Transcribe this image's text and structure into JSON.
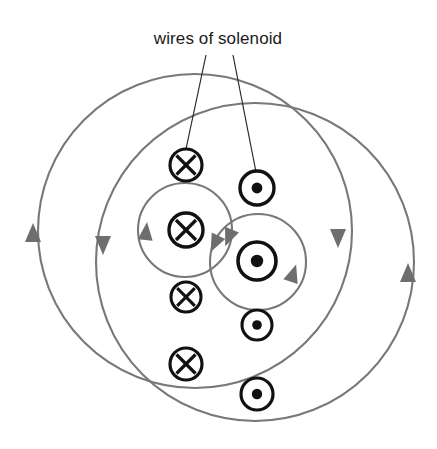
{
  "figure": {
    "title": "wires of solenoid",
    "caption_label": "wires of solenoid",
    "label_position": {
      "x": 218,
      "y": 44
    },
    "colors": {
      "field_line": "#787878",
      "wire_symbol": "#111111",
      "leader_line": "#2a2a2a",
      "label_text": "#1a1a1a",
      "background": "#ffffff"
    },
    "leaders": [
      {
        "name": "leader-to-x-wire",
        "x1": 206,
        "y1": 55,
        "x2": 186,
        "y2": 149
      },
      {
        "name": "leader-to-dot-wire",
        "x1": 233,
        "y1": 55,
        "x2": 256,
        "y2": 172
      }
    ],
    "field_lines": [
      {
        "name": "outer-left-field-line",
        "cx": 195,
        "cy": 231,
        "r": 157,
        "direction": "clockwise"
      },
      {
        "name": "outer-right-field-line",
        "cx": 255,
        "cy": 262,
        "r": 159,
        "direction": "clockwise"
      },
      {
        "name": "inner-left-field-line",
        "cx": 185,
        "cy": 230,
        "r": 47,
        "direction": "clockwise"
      },
      {
        "name": "inner-right-field-line",
        "cx": 258,
        "cy": 262,
        "r": 48,
        "direction": "clockwise"
      }
    ],
    "field_arrows": [
      {
        "name": "arrow-outer-left-west",
        "x": 33,
        "y": 232,
        "rotation": 0
      },
      {
        "name": "arrow-outer-left-east",
        "x": 338,
        "y": 239,
        "rotation": 180
      },
      {
        "name": "arrow-outer-right-west",
        "x": 103,
        "y": 246,
        "rotation": 180
      },
      {
        "name": "arrow-outer-right-east",
        "x": 408,
        "y": 272,
        "rotation": 0
      },
      {
        "name": "arrow-inner-left-west",
        "x": 145,
        "y": 232,
        "rotation": 5
      },
      {
        "name": "arrow-inner-left-east",
        "x": 216,
        "y": 244,
        "rotation": 205
      },
      {
        "name": "arrow-inner-right-west",
        "x": 230,
        "y": 237,
        "rotation": 200
      },
      {
        "name": "arrow-inner-right-east",
        "x": 294,
        "y": 274,
        "rotation": 18
      }
    ],
    "wire_symbols": [
      {
        "name": "wire-current-into-page-1",
        "type": "cross",
        "label": "x",
        "cx": 186,
        "cy": 165,
        "r": 16
      },
      {
        "name": "wire-current-into-page-2",
        "type": "cross",
        "label": "x",
        "cx": 186,
        "cy": 230,
        "r": 17
      },
      {
        "name": "wire-current-into-page-3",
        "type": "cross",
        "label": "x",
        "cx": 186,
        "cy": 297,
        "r": 15
      },
      {
        "name": "wire-current-into-page-4",
        "type": "cross",
        "label": "x",
        "cx": 186,
        "cy": 364,
        "r": 16
      },
      {
        "name": "wire-current-out-of-page-1",
        "type": "dot",
        "label": "•",
        "cx": 257,
        "cy": 188,
        "r": 17
      },
      {
        "name": "wire-current-out-of-page-2",
        "type": "dot",
        "label": "•",
        "cx": 257,
        "cy": 261,
        "r": 19
      },
      {
        "name": "wire-current-out-of-page-3",
        "type": "dot",
        "label": "•",
        "cx": 257,
        "cy": 325,
        "r": 15
      },
      {
        "name": "wire-current-out-of-page-4",
        "type": "dot",
        "label": "•",
        "cx": 257,
        "cy": 394,
        "r": 16
      }
    ]
  }
}
